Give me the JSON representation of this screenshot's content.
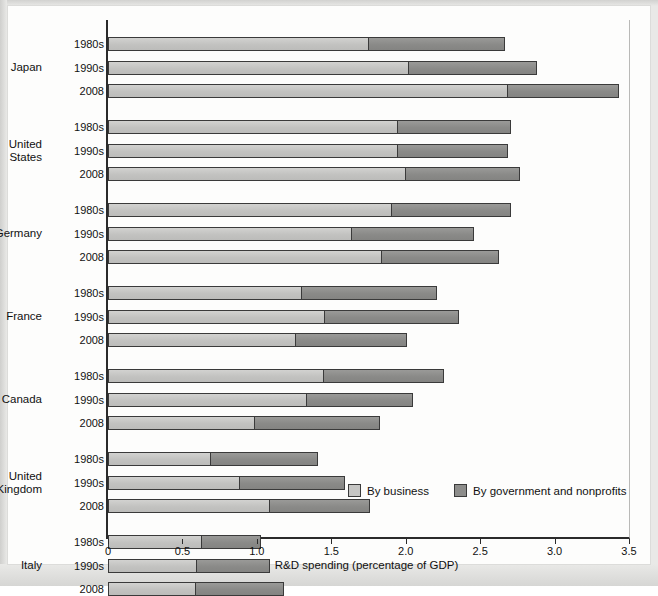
{
  "chart_data": {
    "type": "bar",
    "orientation": "horizontal",
    "stacked": true,
    "title": "",
    "xlabel": "R&D spending (percentage of GDP)",
    "ylabel": "",
    "xlim": [
      0,
      3.5
    ],
    "xticks": [
      0,
      0.5,
      1.0,
      1.5,
      2.0,
      2.5,
      3.0,
      3.5
    ],
    "xtick_labels": [
      "0",
      "0.5",
      "1.0",
      "1.5",
      "2.0",
      "2.5",
      "3.0",
      "3.5"
    ],
    "grid": false,
    "legend_position": "inside-bottom-right",
    "series": [
      {
        "name": "By business",
        "color": "#c6c6c4"
      },
      {
        "name": "By government and nonprofits",
        "color": "#8d8d8b"
      }
    ],
    "groups": [
      {
        "country": "Japan",
        "rows": [
          {
            "period": "1980s",
            "business": 1.75,
            "government": 0.92,
            "total": 2.67
          },
          {
            "period": "1990s",
            "business": 2.02,
            "government": 0.86,
            "total": 2.88
          },
          {
            "period": "2008",
            "business": 2.69,
            "government": 0.74,
            "total": 3.43
          }
        ]
      },
      {
        "country": "United States",
        "rows": [
          {
            "period": "1980s",
            "business": 1.95,
            "government": 0.76,
            "total": 2.71
          },
          {
            "period": "1990s",
            "business": 1.95,
            "government": 0.74,
            "total": 2.69
          },
          {
            "period": "2008",
            "business": 2.0,
            "government": 0.77,
            "total": 2.77
          }
        ]
      },
      {
        "country": "Germany",
        "rows": [
          {
            "period": "1980s",
            "business": 1.91,
            "government": 0.8,
            "total": 2.71
          },
          {
            "period": "1990s",
            "business": 1.64,
            "government": 0.82,
            "total": 2.46
          },
          {
            "period": "2008",
            "business": 1.84,
            "government": 0.79,
            "total": 2.63
          }
        ]
      },
      {
        "country": "France",
        "rows": [
          {
            "period": "1980s",
            "business": 1.3,
            "government": 0.91,
            "total": 2.21
          },
          {
            "period": "1990s",
            "business": 1.46,
            "government": 0.9,
            "total": 2.36
          },
          {
            "period": "2008",
            "business": 1.26,
            "government": 0.75,
            "total": 2.01
          }
        ]
      },
      {
        "country": "Canada",
        "rows": [
          {
            "period": "1980s",
            "business": 1.45,
            "government": 0.81,
            "total": 2.26
          },
          {
            "period": "1990s",
            "business": 1.34,
            "government": 0.71,
            "total": 2.05
          },
          {
            "period": "2008",
            "business": 0.99,
            "government": 0.84,
            "total": 1.83
          }
        ]
      },
      {
        "country": "United Kingdom",
        "rows": [
          {
            "period": "1980s",
            "business": 0.69,
            "government": 0.72,
            "total": 1.41
          },
          {
            "period": "1990s",
            "business": 0.89,
            "government": 0.7,
            "total": 1.59
          },
          {
            "period": "2008",
            "business": 1.09,
            "government": 0.67,
            "total": 1.76
          }
        ]
      },
      {
        "country": "Italy",
        "rows": [
          {
            "period": "1980s",
            "business": 0.63,
            "government": 0.4,
            "total": 1.03
          },
          {
            "period": "1990s",
            "business": 0.6,
            "government": 0.49,
            "total": 1.09
          },
          {
            "period": "2008",
            "business": 0.59,
            "government": 0.59,
            "total": 1.18
          }
        ]
      }
    ]
  },
  "legend": {
    "items": [
      {
        "label": "By business",
        "color": "#c6c6c4"
      },
      {
        "label": "By government and nonprofits",
        "color": "#8d8d8b"
      }
    ]
  },
  "axis": {
    "x_title": "R&D spending (percentage of GDP)",
    "x_tick_labels": [
      "0",
      "0.5",
      "1.0",
      "1.5",
      "2.0",
      "2.5",
      "3.0",
      "3.5"
    ]
  },
  "country_label_lines": {
    "Japan": "Japan",
    "United States": "United\nStates",
    "Germany": "Germany",
    "France": "France",
    "Canada": "Canada",
    "United Kingdom": "United\nKingdom",
    "Italy": "Italy"
  }
}
